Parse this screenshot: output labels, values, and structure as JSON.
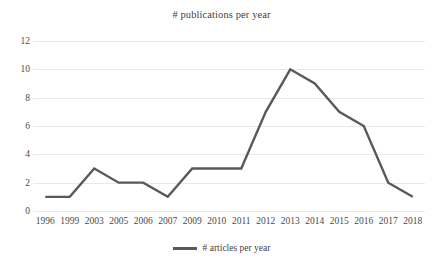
{
  "chart_data": {
    "type": "line",
    "title": "# publications per year",
    "xlabel": "",
    "ylabel": "",
    "categories": [
      "1996",
      "1999",
      "2003",
      "2005",
      "2006",
      "2007",
      "2009",
      "2010",
      "2011",
      "2012",
      "2013",
      "2014",
      "2015",
      "2016",
      "2017",
      "2018"
    ],
    "series": [
      {
        "name": "# articles per year",
        "color": "#595959",
        "values": [
          1,
          1,
          3,
          2,
          2,
          1,
          3,
          3,
          3,
          7,
          10,
          9,
          7,
          6,
          2,
          1
        ]
      }
    ],
    "ylim": [
      0,
      12
    ],
    "y_ticks": [
      0,
      2,
      4,
      6,
      8,
      10,
      12
    ],
    "grid": true,
    "grid_color": "#e8e8e8",
    "legend_position": "bottom",
    "legend_entries": [
      "# articles per year"
    ]
  },
  "legend": {
    "marker_name": "line-swatch",
    "label": "# articles per year"
  }
}
